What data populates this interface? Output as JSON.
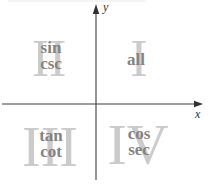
{
  "axes": {
    "x_label": "x",
    "y_label": "y"
  },
  "quadrants": [
    {
      "numeral": "I",
      "position": "top-right",
      "lines": [
        "all",
        ""
      ]
    },
    {
      "numeral": "II",
      "position": "top-left",
      "lines": [
        "sin",
        "csc"
      ]
    },
    {
      "numeral": "III",
      "position": "bottom-left",
      "lines": [
        "tan",
        "cot"
      ]
    },
    {
      "numeral": "IV",
      "position": "bottom-right",
      "lines": [
        "cos",
        "sec"
      ]
    }
  ],
  "colors": {
    "numeral": "#cbcbcb",
    "function_text": "#828282",
    "axis": "#3f3f3f",
    "axis_label": "#2f2f2f",
    "background": "#ffffff"
  }
}
